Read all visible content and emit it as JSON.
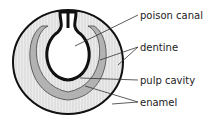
{
  "diagram": {
    "labels": [
      {
        "id": "poison-canal",
        "text": "poison canal",
        "x": 140,
        "y": 11
      },
      {
        "id": "dentine",
        "text": "dentine",
        "x": 140,
        "y": 43
      },
      {
        "id": "pulp-cavity",
        "text": "pulp cavity",
        "x": 140,
        "y": 76
      },
      {
        "id": "enamel",
        "text": "enamel",
        "x": 140,
        "y": 98
      }
    ],
    "colors": {
      "outline": "#111111",
      "enamel_fill": "#e6e6e6",
      "dentine_fill": "#bdbdbd",
      "pulp_fill": "#ffffff",
      "leader": "#333333"
    }
  }
}
